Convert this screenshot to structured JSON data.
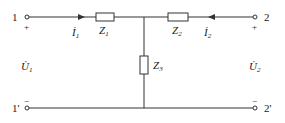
{
  "diagram": {
    "type": "T-network two-port circuit",
    "terminals": {
      "port1_top": "1",
      "port1_bottom": "1'",
      "port2_top": "2",
      "port2_bottom": "2'"
    },
    "polarity": {
      "plus": "+",
      "minus": "−"
    },
    "impedances": {
      "z1": {
        "main": "Z",
        "sub": "1"
      },
      "z2": {
        "main": "Z",
        "sub": "2"
      },
      "z3": {
        "main": "Z",
        "sub": "3"
      }
    },
    "currents": {
      "i1": {
        "main": "İ",
        "sub": "1"
      },
      "i2": {
        "main": "İ",
        "sub": "2"
      }
    },
    "voltages": {
      "u1": {
        "main": "U̇",
        "sub": "1"
      },
      "u2": {
        "main": "U̇",
        "sub": "2"
      }
    },
    "colors": {
      "line": "#333333",
      "background": "#ffffff"
    }
  }
}
